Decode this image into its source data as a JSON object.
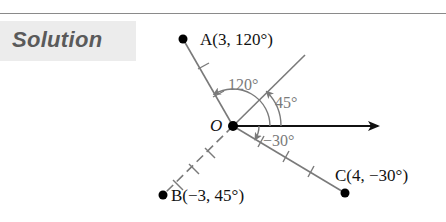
{
  "header": {
    "section_label": "Solution"
  },
  "diagram": {
    "origin": {
      "label": "O",
      "x": 233,
      "y": 126
    },
    "points": [
      {
        "name": "A",
        "label": "A(3, 120°)",
        "r": 3,
        "theta_deg": 120
      },
      {
        "name": "B",
        "label": "B(−3, 45°)",
        "r": -3,
        "theta_deg": 45
      },
      {
        "name": "C",
        "label": "C(4, −30°)",
        "r": 4,
        "theta_deg": -30
      }
    ],
    "angles": [
      {
        "label": "120°",
        "deg": 120
      },
      {
        "label": "45°",
        "deg": 45
      },
      {
        "label": "−30°",
        "deg": -30
      }
    ],
    "colors": {
      "axis": "#111111",
      "ray": "#7a7a7a",
      "point": "#000000",
      "angle_text": "#7a7a7a",
      "header_bg": "#ececec",
      "header_text": "#5a5a5a"
    }
  }
}
